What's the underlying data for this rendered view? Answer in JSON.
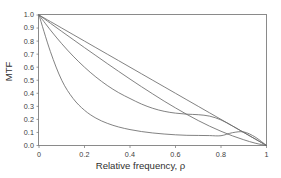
{
  "chart_data": {
    "type": "line",
    "title": "",
    "subtitle": "",
    "xlabel": "Relative frequency, ρ",
    "ylabel": "MTF",
    "xlim": [
      0,
      1
    ],
    "ylim": [
      0,
      1
    ],
    "grid": false,
    "legend": "none",
    "xticks": [
      "0",
      "0.2",
      "0.4",
      "0.6",
      "0.8",
      "1"
    ],
    "xtick_values": [
      0,
      0.2,
      0.4,
      0.6,
      0.8,
      1
    ],
    "yticks": [
      "0.0",
      "0.1",
      "0.2",
      "0.3",
      "0.4",
      "0.5",
      "0.6",
      "0.7",
      "0.8",
      "0.9",
      "1.0"
    ],
    "ytick_values": [
      0,
      0.1,
      0.2,
      0.3,
      0.4,
      0.5,
      0.6,
      0.7,
      0.8,
      0.9,
      1.0
    ],
    "line_color": "#6b6b6b",
    "axis_color": "#808080",
    "background_color": "#ffffff",
    "x": [
      0,
      0.05,
      0.1,
      0.15,
      0.2,
      0.25,
      0.3,
      0.35,
      0.4,
      0.45,
      0.5,
      0.55,
      0.6,
      0.65,
      0.7,
      0.75,
      0.8,
      0.85,
      0.9,
      0.95,
      1.0
    ],
    "series": [
      {
        "name": "curve-1-near-linear",
        "values": [
          1.0,
          0.95,
          0.9,
          0.85,
          0.8,
          0.75,
          0.7,
          0.65,
          0.6,
          0.55,
          0.5,
          0.45,
          0.4,
          0.35,
          0.3,
          0.25,
          0.2,
          0.15,
          0.1,
          0.05,
          0.0
        ]
      },
      {
        "name": "curve-2-diffraction",
        "values": [
          1.0,
          0.937,
          0.874,
          0.812,
          0.75,
          0.689,
          0.628,
          0.568,
          0.509,
          0.451,
          0.395,
          0.34,
          0.288,
          0.238,
          0.191,
          0.148,
          0.109,
          0.074,
          0.044,
          0.018,
          0.0
        ]
      },
      {
        "name": "curve-3-intermediate",
        "values": [
          1.0,
          0.885,
          0.78,
          0.685,
          0.6,
          0.525,
          0.46,
          0.405,
          0.36,
          0.318,
          0.285,
          0.262,
          0.248,
          0.24,
          0.236,
          0.225,
          0.196,
          0.15,
          0.1,
          0.05,
          0.0
        ]
      },
      {
        "name": "curve-4-steep",
        "values": [
          1.0,
          0.72,
          0.5,
          0.36,
          0.27,
          0.21,
          0.17,
          0.142,
          0.122,
          0.107,
          0.096,
          0.088,
          0.082,
          0.078,
          0.077,
          0.076,
          0.075,
          0.098,
          0.104,
          0.065,
          0.0
        ]
      }
    ]
  },
  "axes": {
    "x_title": "Relative frequency, ρ",
    "y_title": "MTF"
  }
}
